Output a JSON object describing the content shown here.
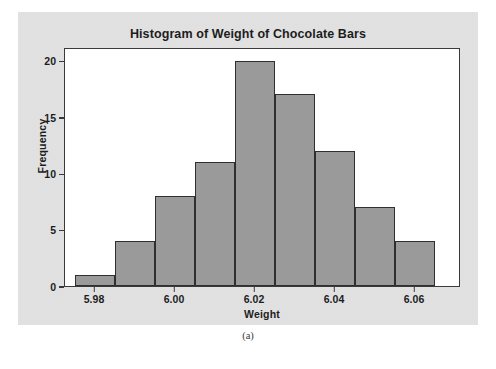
{
  "figure": {
    "caption": "(a)",
    "panel_bg": "#e1e1e1",
    "plot_bg": "#ffffff",
    "frame_color": "#3a3a3a"
  },
  "chart_data": {
    "type": "bar",
    "subtype": "histogram",
    "title": "Histogram of Weight of Chocolate Bars",
    "xlabel": "Weight",
    "ylabel": "Frequency",
    "bar_color": "#9a9a9a",
    "bar_edge_color": "#2f2f2f",
    "grid": false,
    "legend": "none",
    "bin_width": 0.01,
    "bin_edges": [
      5.975,
      5.985,
      5.995,
      6.005,
      6.015,
      6.025,
      6.035,
      6.045,
      6.055,
      6.065
    ],
    "bin_centers": [
      5.98,
      5.99,
      6.0,
      6.01,
      6.02,
      6.03,
      6.04,
      6.05,
      6.06
    ],
    "categories": [
      "5.980",
      "5.990",
      "6.000",
      "6.010",
      "6.020",
      "6.030",
      "6.040",
      "6.050",
      "6.060"
    ],
    "values": [
      1,
      4,
      8,
      11,
      20,
      17,
      12,
      7,
      4
    ],
    "total_count": 84,
    "xlim": [
      5.9725,
      6.0715
    ],
    "ylim": [
      0,
      21.2
    ],
    "xticks": [
      5.98,
      6.0,
      6.02,
      6.04,
      6.06
    ],
    "xtick_labels": [
      "5.98",
      "6.00",
      "6.02",
      "6.04",
      "6.06"
    ],
    "yticks": [
      0,
      5,
      10,
      15,
      20
    ],
    "ytick_labels": [
      "0",
      "5",
      "10",
      "15",
      "20"
    ]
  }
}
